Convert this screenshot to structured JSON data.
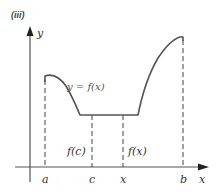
{
  "figure": {
    "panel_label": "(iii)",
    "y_axis_label": "y",
    "x_axis_label": "x",
    "curve_label": "y = f(x)",
    "tick_labels": {
      "a": "a",
      "c": "c",
      "x": "x",
      "b": "b"
    },
    "height_labels": {
      "fc": "f(c)",
      "fx": "f(x)"
    },
    "colors": {
      "curve": "#555555",
      "axis": "#555555",
      "dashed": "#444444",
      "arrow": "#222222",
      "background": "#ffffff"
    }
  }
}
